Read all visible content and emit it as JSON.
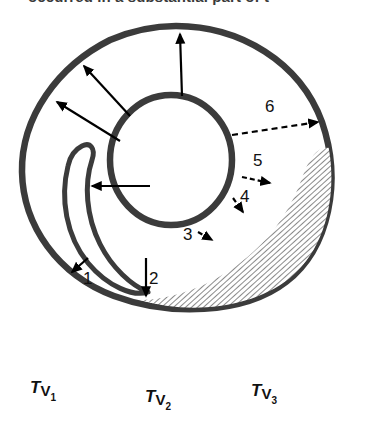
{
  "figure": {
    "title_fragment": "occurred in a substantial part of t",
    "type": "anatomical-cross-section-diagram",
    "colors": {
      "outline": "#3b3b3b",
      "arrow": "#000000",
      "hatch": "#8c8c8c",
      "background": "#ffffff",
      "text": "#111111"
    }
  },
  "callouts": [
    {
      "id": "1",
      "label": "1",
      "style": "solid-arrow",
      "x": 83,
      "y": 270
    },
    {
      "id": "2",
      "label": "2",
      "style": "solid-arrow",
      "x": 149,
      "y": 270
    },
    {
      "id": "3",
      "label": "3",
      "style": "dashed-arrow",
      "x": 191,
      "y": 234
    },
    {
      "id": "4",
      "label": "4",
      "style": "dashed-arrow",
      "x": 240,
      "y": 195
    },
    {
      "id": "5",
      "label": "5",
      "style": "dashed-arrow",
      "x": 253,
      "y": 158
    },
    {
      "id": "6",
      "label": "6",
      "style": "dashed-arrow",
      "x": 265,
      "y": 103
    }
  ],
  "radial_arrows": {
    "count": 4,
    "style": "solid",
    "direction": "outward-from-inner-lumen"
  },
  "tissue_volume_labels": [
    {
      "id": "tv1",
      "main": "T",
      "sub": "V",
      "subnum": "1",
      "x": 30,
      "y": 379
    },
    {
      "id": "tv2",
      "main": "T",
      "sub": "V",
      "subnum": "2",
      "x": 145,
      "y": 388
    },
    {
      "id": "tv3",
      "main": "T",
      "sub": "V",
      "subnum": "3",
      "x": 251,
      "y": 382
    }
  ]
}
